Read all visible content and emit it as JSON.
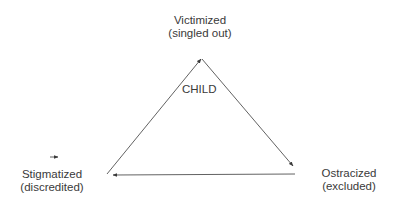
{
  "diagram": {
    "center_label": "CHILD",
    "nodes": [
      {
        "id": "top",
        "title": "Victimized",
        "subtitle": "(singled out)"
      },
      {
        "id": "right",
        "title": "Ostracized",
        "subtitle": "(excluded)"
      },
      {
        "id": "left",
        "title": "Stigmatized",
        "subtitle": "(discredited)"
      }
    ],
    "edges": [
      {
        "from": "left",
        "to": "top"
      },
      {
        "from": "top",
        "to": "right"
      },
      {
        "from": "right",
        "to": "left"
      }
    ],
    "colors": {
      "line": "#3a3a3a",
      "text": "#3a3a3a",
      "background": "#ffffff"
    }
  }
}
